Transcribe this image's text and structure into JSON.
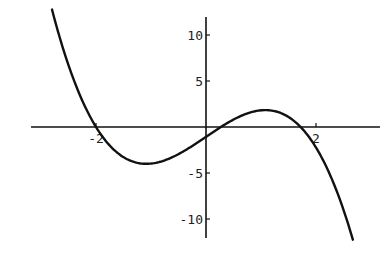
{
  "chart_data": {
    "type": "line",
    "title": "",
    "xlabel": "",
    "ylabel": "",
    "xlim": [
      -3.2,
      3.2
    ],
    "ylim": [
      -12,
      12
    ],
    "grid": false,
    "legend": null,
    "x_ticks": [
      {
        "value": -2,
        "label": "-2"
      },
      {
        "value": 2,
        "label": "2"
      }
    ],
    "y_ticks": [
      {
        "value": 10,
        "label": "10"
      },
      {
        "value": 5,
        "label": "5"
      },
      {
        "value": -5,
        "label": "-5"
      },
      {
        "value": -10,
        "label": "-10"
      }
    ],
    "series": [
      {
        "name": "cubic curve",
        "description": "cubic with roots near x = -2, 0.27, 1.72; local min about (-1.1, -3.9); local max about (1.1, 1.85); y-intercept about -1",
        "x": [
          -2.8,
          -2.6,
          -2.4,
          -2.2,
          -2.0,
          -1.8,
          -1.6,
          -1.4,
          -1.2,
          -1.0,
          -0.8,
          -0.6,
          -0.4,
          -0.2,
          0.0,
          0.2,
          0.4,
          0.6,
          0.8,
          1.0,
          1.2,
          1.4,
          1.6,
          1.8,
          2.0,
          2.2,
          2.4,
          2.6,
          2.67
        ],
        "y": [
          12.8,
          9.5,
          6.6,
          3.1,
          0.0,
          -1.9,
          -3.1,
          -3.8,
          -4.0,
          -3.9,
          -3.4,
          -2.8,
          -2.2,
          -1.6,
          -1.1,
          -0.2,
          0.4,
          1.0,
          1.5,
          1.8,
          1.8,
          1.4,
          0.6,
          -0.5,
          -1.9,
          -4.0,
          -6.6,
          -9.7,
          -12.2
        ]
      }
    ]
  },
  "plot_geometry": {
    "origin_px": [
      206,
      127
    ],
    "px_per_x_unit": 55,
    "px_per_y_unit": 9.2,
    "x_axis_px": [
      31,
      380
    ],
    "y_axis_px": [
      17,
      238
    ]
  }
}
